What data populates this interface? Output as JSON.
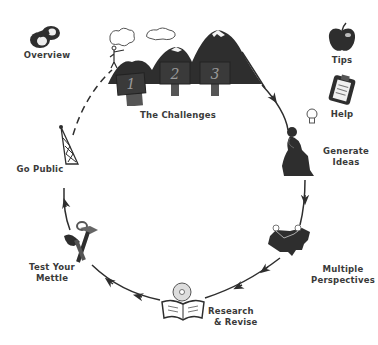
{
  "nav": {
    "overview": {
      "label": "Overview",
      "icon": "binoculars-icon"
    },
    "tips": {
      "label": "Tips",
      "icon": "apple-icon"
    },
    "help": {
      "label": "Help",
      "icon": "clipboard-icon"
    }
  },
  "cycle": {
    "stages": [
      {
        "id": "challenges",
        "label": "The Challenges",
        "icon": "mountains-icon",
        "signs": [
          "1",
          "2",
          "3"
        ]
      },
      {
        "id": "generate-ideas",
        "label_line1": "Generate",
        "label_line2": "Ideas",
        "icon": "thinker-icon"
      },
      {
        "id": "multiple-perspectives",
        "label_line1": "Multiple",
        "label_line2": "Perspectives",
        "icon": "usa-map-icon"
      },
      {
        "id": "research-revise",
        "label_line1": "Research",
        "label_line2": "& Revise",
        "icon": "book-cd-icon"
      },
      {
        "id": "test-your-mettle",
        "label_line1": "Test Your",
        "label_line2": "Mettle",
        "icon": "tools-icon"
      },
      {
        "id": "go-public",
        "label": "Go Public",
        "icon": "radio-tower-icon"
      }
    ]
  },
  "colors": {
    "ink": "#2e2e2e",
    "label": "#3a3a3a",
    "snow": "#f4f4f4",
    "background": "#ffffff"
  }
}
